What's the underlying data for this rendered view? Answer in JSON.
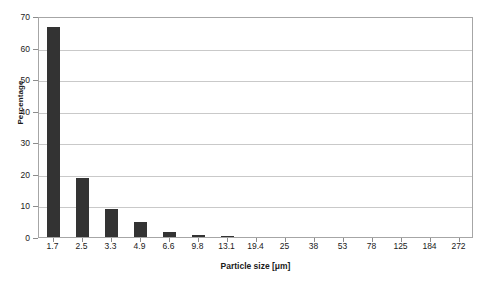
{
  "chart_data": {
    "type": "bar",
    "title": "",
    "xlabel": "Particle size [μm]",
    "ylabel": "Percentage",
    "categories": [
      "1.7",
      "2.5",
      "3.3",
      "4.9",
      "6.6",
      "9.8",
      "13.1",
      "19.4",
      "25",
      "38",
      "53",
      "78",
      "125",
      "184",
      "272"
    ],
    "values": [
      66.5,
      18.8,
      8.8,
      4.6,
      1.5,
      0.6,
      0.2,
      0,
      0,
      0,
      0,
      0,
      0,
      0,
      0
    ],
    "ylim": [
      0,
      70
    ],
    "yticks": [
      "0",
      "10",
      "20",
      "30",
      "40",
      "50",
      "60",
      "70"
    ],
    "ytick_values": [
      0,
      10,
      20,
      30,
      40,
      50,
      60,
      70
    ],
    "grid": true,
    "legend": "none",
    "bar_color": "#333333",
    "gridline_color": "#c9c9c9",
    "frame_color": "#a6a6a6",
    "background_color": "#ffffff"
  }
}
